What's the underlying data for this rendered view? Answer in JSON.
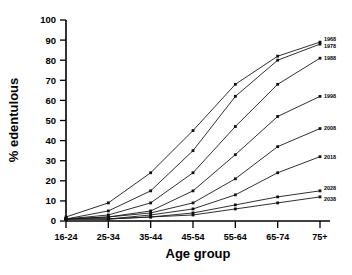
{
  "chart_data": {
    "type": "line",
    "title": "",
    "xlabel": "Age group",
    "ylabel": "% edentulous",
    "categories": [
      "16-24",
      "25-34",
      "35-44",
      "45-54",
      "55-64",
      "65-74",
      "75+"
    ],
    "ylim": [
      0,
      100
    ],
    "yticks": [
      0,
      10,
      20,
      30,
      40,
      50,
      60,
      70,
      80,
      90,
      100
    ],
    "grid": false,
    "legend_position": "right-inline-labels",
    "series": [
      {
        "name": "1968",
        "values": [
          2,
          9,
          24,
          45,
          68,
          82,
          89
        ]
      },
      {
        "name": "1978",
        "values": [
          1,
          5,
          15,
          35,
          62,
          80,
          88
        ]
      },
      {
        "name": "1988",
        "values": [
          1,
          3,
          9,
          24,
          47,
          68,
          81
        ]
      },
      {
        "name": "1998",
        "values": [
          1,
          2,
          5,
          15,
          33,
          52,
          62
        ]
      },
      {
        "name": "2008",
        "values": [
          1,
          2,
          4,
          9,
          21,
          37,
          46
        ]
      },
      {
        "name": "2018",
        "values": [
          1,
          1,
          3,
          6,
          13,
          24,
          32
        ]
      },
      {
        "name": "2028",
        "values": [
          1,
          1,
          2,
          4,
          8,
          12,
          15
        ]
      },
      {
        "name": "2038",
        "values": [
          1,
          1,
          2,
          3,
          6,
          9,
          12
        ]
      }
    ]
  },
  "axes": {
    "y_tick_labels": [
      "100",
      "90",
      "80",
      "70",
      "60",
      "50",
      "40",
      "30",
      "20",
      "10",
      "0"
    ],
    "y_title": "% edentulous",
    "x_title": "Age group",
    "x_tick_labels": [
      "16-24",
      "25-34",
      "35-44",
      "45-54",
      "55-64",
      "65-74",
      "75+"
    ]
  },
  "style": {
    "line_color": "#1a1a1a",
    "axis_color": "#000000",
    "background": "#ffffff"
  }
}
